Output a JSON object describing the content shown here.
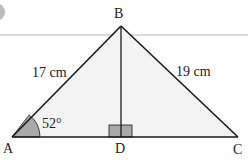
{
  "diagram": {
    "type": "triangle",
    "vertices": {
      "A": {
        "label": "A"
      },
      "B": {
        "label": "B"
      },
      "C": {
        "label": "C"
      },
      "D": {
        "label": "D"
      }
    },
    "side_AB": "17 cm",
    "side_BC": "19 cm",
    "angle_A": "52°",
    "right_angle_at": "D",
    "colors": {
      "fill": "#f3f3f3",
      "stroke": "#1a1a1a",
      "angle_fill": "#a9a9a9",
      "square_fill": "#a9a9a9",
      "divider": "#cccccc"
    }
  }
}
